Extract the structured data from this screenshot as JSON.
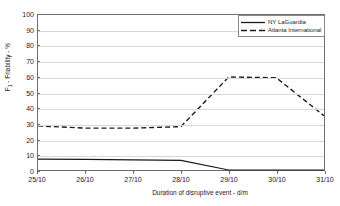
{
  "chart_data": {
    "type": "line",
    "title": "",
    "xlabel": "Duration of disruptive event - d/m",
    "ylabel": "F1 - Friability - %",
    "ylabel_prefix": "F",
    "ylabel_subscript": "1",
    "ylabel_suffix": " - Friability - %",
    "categories": [
      "25/10",
      "26/10",
      "27/10",
      "28/10",
      "29/10",
      "30/10",
      "31/10"
    ],
    "ylim": [
      0,
      100
    ],
    "ytick_labels": [
      "0",
      "10",
      "20",
      "30",
      "40",
      "50",
      "60",
      "70",
      "80",
      "90",
      "100"
    ],
    "ytick_values": [
      0,
      10,
      20,
      30,
      40,
      50,
      60,
      70,
      80,
      90,
      100
    ],
    "grid": true,
    "grid_axis": "y",
    "legend_position": "top-right",
    "series": [
      {
        "name": "NY LaGuardia",
        "style": "solid",
        "color": "#1a1a1a",
        "values": [
          7,
          6.8,
          6.5,
          6.2,
          0,
          0,
          0
        ]
      },
      {
        "name": "Atlanta International",
        "style": "dashed",
        "color": "#1a1a1a",
        "values": [
          28.5,
          27,
          27,
          28,
          60,
          59.5,
          35
        ]
      }
    ]
  },
  "axes": {
    "x_title": "Duration of disruptive event - d/m",
    "y_title_main": "F",
    "y_title_sub": "1",
    "y_title_rest": " - Friability - %"
  },
  "legend": {
    "entries": [
      {
        "label": "NY LaGuardia"
      },
      {
        "label": "Atlanta International"
      }
    ]
  }
}
